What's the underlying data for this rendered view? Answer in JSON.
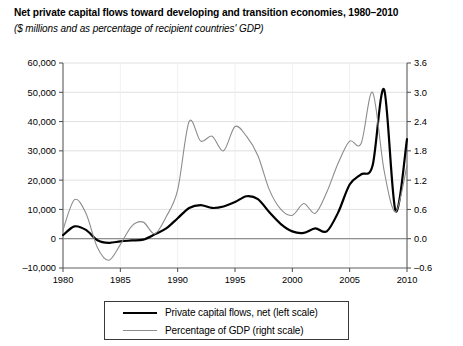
{
  "chart_data": {
    "type": "line",
    "title": "Net private capital flows toward developing and transition economies, 1980–2010",
    "subtitle": "($ millions and as percentage of recipient countries' GDP)",
    "xlabel": "",
    "ylabel": "$ millions",
    "ylabel_right": "percentage of GDP",
    "grid": true,
    "legend_position": "bottom",
    "xlim": [
      1980,
      2010
    ],
    "xticks": [
      1980,
      1985,
      1990,
      1995,
      2000,
      2005,
      2010
    ],
    "xtick_labels": [
      "1980",
      "1985",
      "1990",
      "1995",
      "2000",
      "2005",
      "2010"
    ],
    "ylim": [
      -10000,
      60000
    ],
    "yticks": [
      -10000,
      0,
      10000,
      20000,
      30000,
      40000,
      50000,
      60000
    ],
    "ytick_labels": [
      "–10,000",
      "0",
      "10,000",
      "20,000",
      "30,000",
      "40,000",
      "50,000",
      "60,000"
    ],
    "ylim_right": [
      -0.6,
      3.6
    ],
    "yticks_right": [
      -0.6,
      0.0,
      0.6,
      1.2,
      1.8,
      2.4,
      3.0,
      3.6
    ],
    "ytick_labels_right": [
      "–0.6",
      "0.0",
      "0.6",
      "1.2",
      "1.8",
      "2.4",
      "3.0",
      "3.6"
    ],
    "x": [
      1980,
      1981,
      1982,
      1983,
      1984,
      1985,
      1986,
      1987,
      1988,
      1989,
      1990,
      1991,
      1992,
      1993,
      1994,
      1995,
      1996,
      1997,
      1998,
      1999,
      2000,
      2001,
      2002,
      2003,
      2004,
      2005,
      2006,
      2007,
      2008,
      2009,
      2010
    ],
    "series": [
      {
        "name": "Private capital flows, net (left scale)",
        "axis": "left",
        "color": "#000000",
        "width": 2.2,
        "values": [
          1200,
          4200,
          3000,
          -500,
          -1400,
          -900,
          -600,
          -300,
          1500,
          3500,
          7000,
          10500,
          11500,
          10500,
          11000,
          12500,
          14500,
          13500,
          9000,
          5000,
          2500,
          2000,
          3500,
          2500,
          9000,
          18500,
          22000,
          25000,
          51000,
          9500,
          34000
        ]
      },
      {
        "name": "Percentage of GDP (right scale)",
        "axis": "right",
        "color": "#8c8c8c",
        "width": 1.1,
        "values": [
          0.18,
          0.8,
          0.52,
          -0.18,
          -0.44,
          -0.12,
          0.26,
          0.34,
          0.1,
          0.45,
          1.0,
          2.4,
          2.0,
          2.1,
          1.8,
          2.3,
          2.1,
          1.7,
          1.0,
          0.6,
          0.48,
          0.72,
          0.52,
          0.95,
          1.55,
          2.0,
          1.95,
          3.0,
          1.4,
          0.55,
          1.5
        ]
      }
    ]
  }
}
